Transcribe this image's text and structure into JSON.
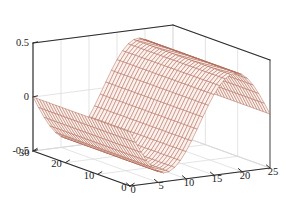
{
  "figure": {
    "kind": "3d-surface-mesh-plot",
    "background_color": "#ffffff",
    "mesh_color": "#a85c48",
    "mesh_face_color": "#fbf0ec",
    "axis_color": "#2b2b2b",
    "grid_color": "#d8d8d8",
    "tick_label_color": "#1a1a1a"
  },
  "chart_data": {
    "type": "surface",
    "title": "",
    "xlabel": "",
    "ylabel": "",
    "zlabel": "",
    "grid": true,
    "legend": null,
    "x": {
      "name": "x-axis-right",
      "ticks": [
        0,
        5,
        10,
        15,
        20,
        25
      ],
      "tick_labels": [
        "0",
        "5",
        "10",
        "15",
        "20",
        "25"
      ],
      "range": [
        0,
        25
      ]
    },
    "y": {
      "name": "y-axis-left",
      "ticks": [
        0,
        10,
        20,
        30
      ],
      "tick_labels": [
        "0",
        "10",
        "20",
        "30"
      ],
      "range": [
        0,
        30
      ]
    },
    "z": {
      "name": "z-axis-vertical",
      "ticks": [
        -0.5,
        0,
        0.5
      ],
      "tick_labels": [
        "-0.5",
        "0",
        "0.5"
      ],
      "range": [
        -0.5,
        0.5
      ]
    },
    "surface": {
      "description": "Single-period sinusoidal ridge-and-trough wave: trough near front-left, crest near back-right, constant along the y direction",
      "function": "z = 0.42 * sin(2*pi*(x/25) + pi)",
      "nx": 26,
      "ny": 31,
      "zmin": -0.42,
      "zmax": 0.42
    },
    "view": {
      "azimuth_deg": -37.5,
      "elevation_deg": 30
    }
  }
}
